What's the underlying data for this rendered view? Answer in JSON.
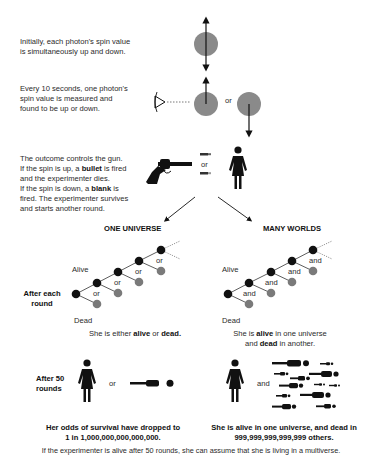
{
  "steps": {
    "initial": [
      "Initially, each photon's spin value",
      "is simultaneously up and down."
    ],
    "measure": [
      "Every 10 seconds, one photon's",
      "spin value is measured and",
      "found to be up or down."
    ],
    "measure_or": "or",
    "gun": {
      "line1": "The outcome controls the gun.",
      "line2_pre": "If the spin is up, a ",
      "line2_bold": "bullet",
      "line2_post": " is fired",
      "line3": "and the experimenter dies.",
      "line4_pre": "If the spin is down, a ",
      "line4_bold": "blank",
      "line4_post": " is",
      "line5": "fired. The experimenter survives",
      "line6": "and starts another round.",
      "or": "or"
    }
  },
  "branches": {
    "one_universe": {
      "title": "ONE UNIVERSE",
      "alive_label": "Alive",
      "dead_label": "Dead",
      "connector": "or",
      "caption_pre": "She is either ",
      "caption_b1": "alive",
      "caption_mid": " or ",
      "caption_b2": "dead.",
      "after50_connector": "or",
      "result_line1": "Her odds of survival have dropped to",
      "result_line2": "1 in 1,000,000,000,000,000."
    },
    "many_worlds": {
      "title": "MANY WORLDS",
      "alive_label": "Alive",
      "dead_label": "Dead",
      "connector": "and",
      "caption_pre": "She is ",
      "caption_b1": "alive",
      "caption_mid": " in one universe",
      "caption_l2_pre": "and ",
      "caption_b2": "dead",
      "caption_l2_post": " in another.",
      "after50_connector": "and",
      "result_line1": "She is alive in one universe, and dead in",
      "result_line2": "999,999,999,999,999 others."
    }
  },
  "row_labels": {
    "after_each_round": [
      "After each",
      "round"
    ],
    "after_50_rounds": [
      "After 50",
      "rounds"
    ]
  },
  "footer": "If the experimenter is alive after 50 rounds, she can assume that she is living in a multiverse.",
  "colors": {
    "photon": "#8a8a8a",
    "node_alive": "#111111",
    "node_dead": "#7a7a7a",
    "ink": "#111111"
  }
}
